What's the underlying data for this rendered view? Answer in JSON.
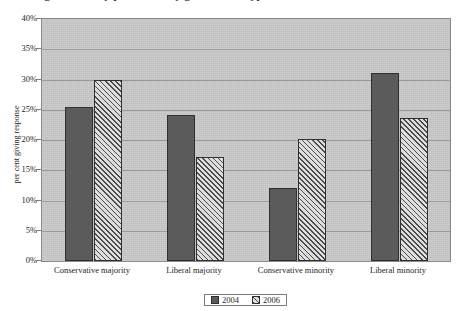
{
  "title": {
    "text": "Figure 4: Party preference by government type",
    "clipped": true
  },
  "axes": {
    "y_label": "per cent giving response",
    "y_ticks": [
      "0%",
      "5%",
      "10%",
      "15%",
      "20%",
      "25%",
      "30%",
      "35%",
      "40%"
    ]
  },
  "legend": {
    "items": [
      {
        "label": "2004",
        "pattern": "solid",
        "color": "#5b5b5b"
      },
      {
        "label": "2006",
        "pattern": "diagonal-hatch",
        "color": "#dedede"
      }
    ]
  },
  "chart_data": {
    "type": "bar",
    "title": "Figure 4: Party preference by government type",
    "xlabel": "",
    "ylabel": "per cent giving response",
    "ylim": [
      0,
      40
    ],
    "ytick_step": 5,
    "ytick_format": "percent",
    "grid": true,
    "legend_position": "bottom",
    "categories": [
      "Conservative majority",
      "Liberal majority",
      "Conservative minority",
      "Liberal minority"
    ],
    "series": [
      {
        "name": "2004",
        "values": [
          25.4,
          24.2,
          12.0,
          31.0
        ]
      },
      {
        "name": "2006",
        "values": [
          30.0,
          17.2,
          20.2,
          23.6
        ]
      }
    ]
  },
  "colors": {
    "plot_background": "#c9c9c9",
    "gridline": "#9a9a9a",
    "border": "#8a8a8a",
    "bar_2004": "#5b5b5b",
    "bar_2006_light": "#dedede",
    "bar_2006_dark": "#4a4a4a",
    "page_background": "#ffffff"
  }
}
